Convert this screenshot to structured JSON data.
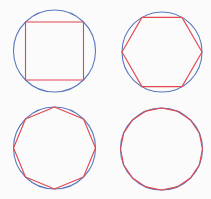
{
  "diagram": {
    "colors": {
      "circle": "#5a78c0",
      "polygon": "#e0474c",
      "background": "#fbfbfb"
    },
    "panels": [
      {
        "id": "square",
        "sides": 4,
        "cx": 54.5,
        "cy": 51,
        "r": 41,
        "rotation_deg": 45
      },
      {
        "id": "hexagon",
        "sides": 6,
        "cx": 162,
        "cy": 52,
        "r": 40,
        "rotation_deg": 0
      },
      {
        "id": "octagon",
        "sides": 8,
        "cx": 54.5,
        "cy": 148,
        "r": 41,
        "rotation_deg": 90
      },
      {
        "id": "hexadecagon",
        "sides": 16,
        "cx": 161.5,
        "cy": 149,
        "r": 41,
        "rotation_deg": 90
      }
    ]
  }
}
